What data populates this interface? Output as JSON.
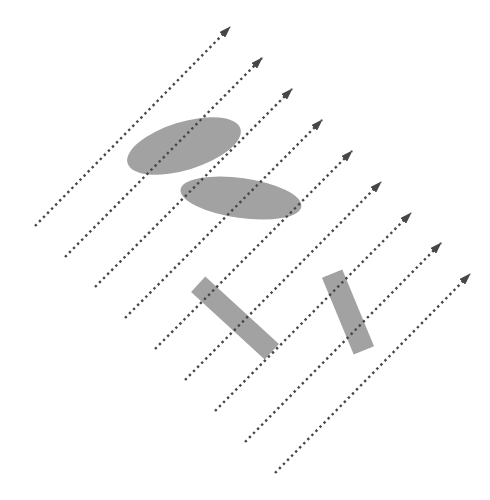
{
  "diagram": {
    "colors": {
      "background": "#ffffff",
      "ray": "#474747",
      "obstacle": "#a2a2a2"
    },
    "rays": [
      {
        "x1": 35,
        "y1": 226,
        "x2": 230,
        "y2": 27
      },
      {
        "x1": 65,
        "y1": 257,
        "x2": 262,
        "y2": 58
      },
      {
        "x1": 95,
        "y1": 287,
        "x2": 292,
        "y2": 89
      },
      {
        "x1": 125,
        "y1": 318,
        "x2": 322,
        "y2": 120
      },
      {
        "x1": 155,
        "y1": 349,
        "x2": 352,
        "y2": 151
      },
      {
        "x1": 185,
        "y1": 380,
        "x2": 381,
        "y2": 182
      },
      {
        "x1": 215,
        "y1": 411,
        "x2": 411,
        "y2": 213
      },
      {
        "x1": 245,
        "y1": 442,
        "x2": 441,
        "y2": 243
      },
      {
        "x1": 275,
        "y1": 473,
        "x2": 470,
        "y2": 274
      }
    ],
    "ellipses": [
      {
        "name": "ellipse-upper",
        "cx": 184,
        "cy": 146,
        "rx": 59,
        "ry": 24,
        "angle": -17
      },
      {
        "name": "ellipse-lower",
        "cx": 241,
        "cy": 198,
        "rx": 61,
        "ry": 20,
        "angle": 8
      }
    ],
    "rectangles": [
      {
        "name": "rect-left",
        "cx": 235,
        "cy": 318,
        "length": 100,
        "width": 21,
        "angle": 42.6
      },
      {
        "name": "rect-right",
        "cx": 348,
        "cy": 312,
        "length": 83,
        "width": 22,
        "angle": 67.5
      }
    ]
  }
}
